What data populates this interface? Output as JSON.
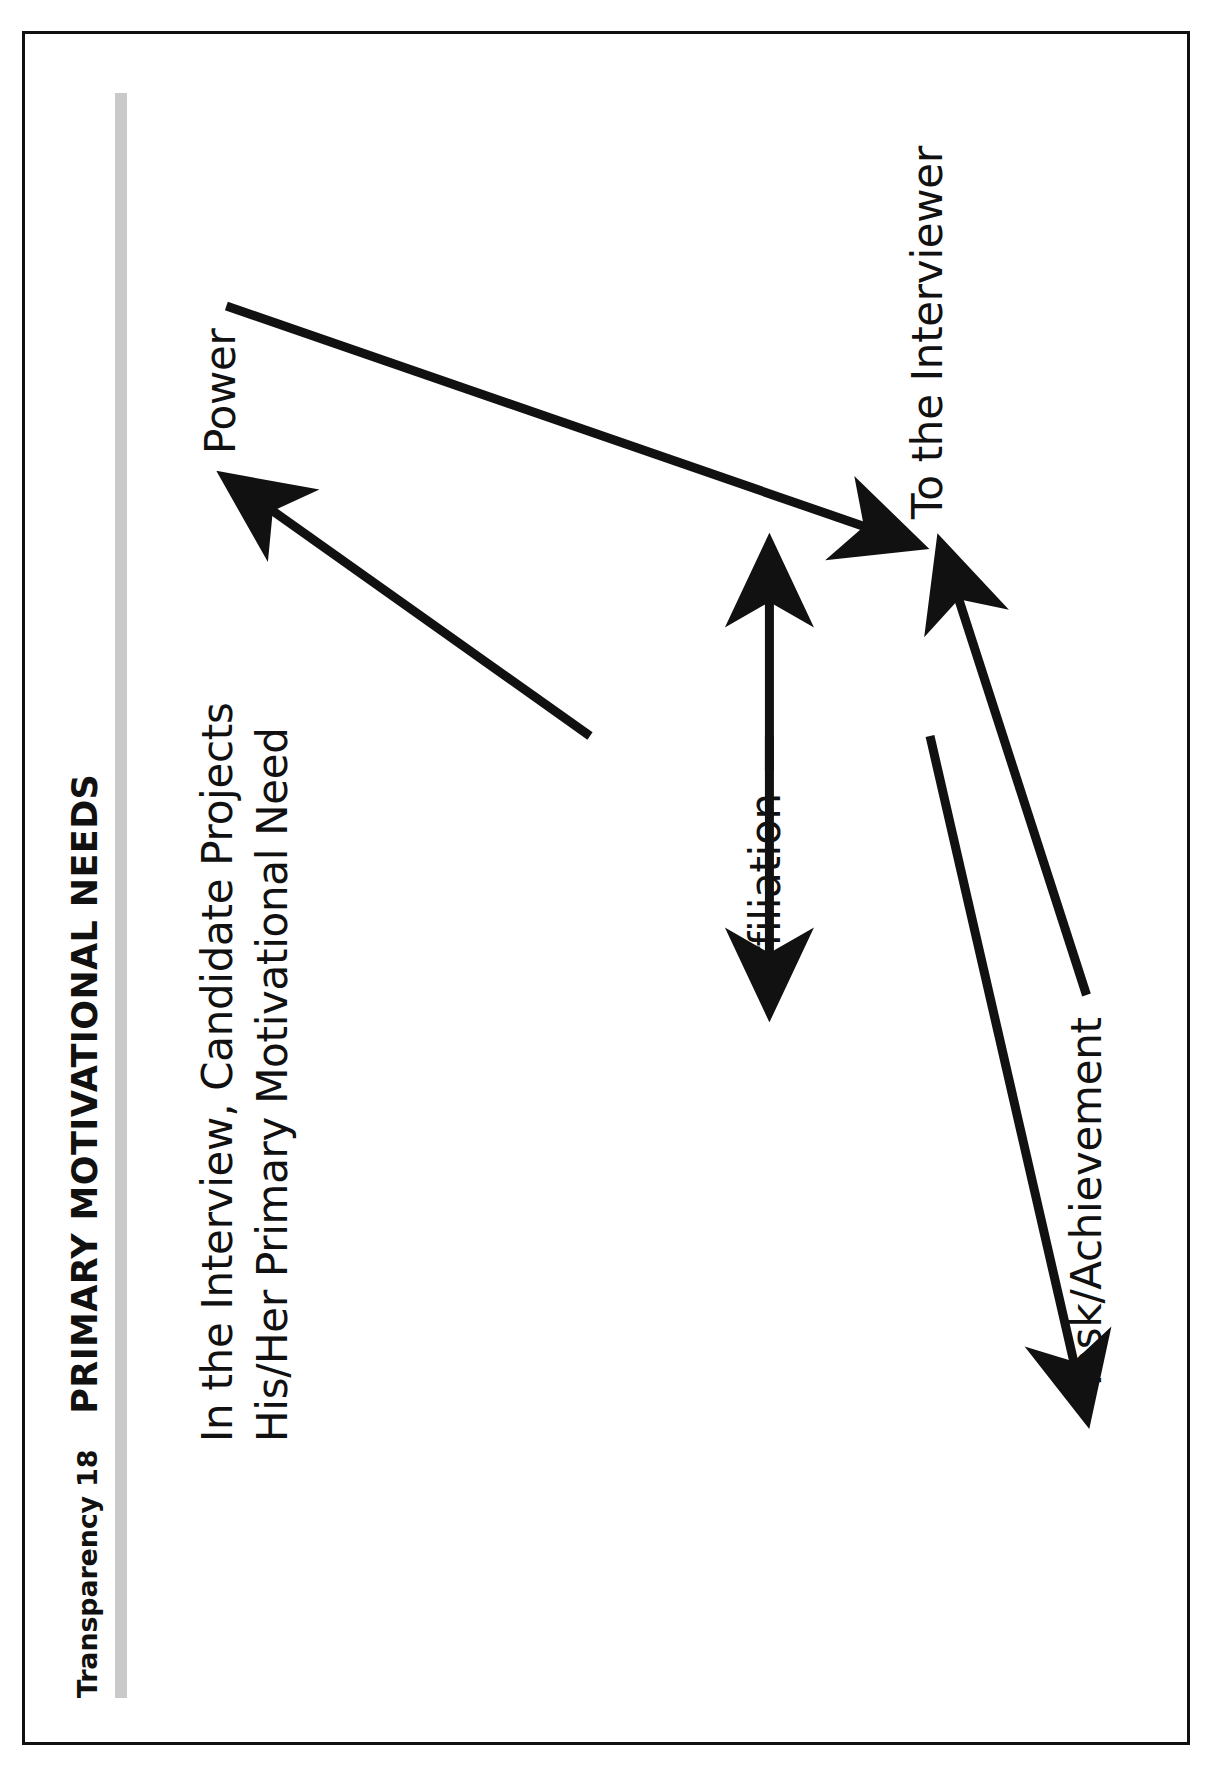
{
  "slide": {
    "transparency_label": "Transparency 18",
    "title": "PRIMARY MOTIVATIONAL NEEDS",
    "rule_color": "#c9c9c9",
    "border_color": "#111111",
    "background_color": "#ffffff",
    "text_color": "#111111"
  },
  "intro": {
    "line1": "In the Interview, Candidate Projects",
    "line2": "His/Her Primary Motivational Need"
  },
  "diagram": {
    "type": "flow",
    "source_label": "In the Interview, Candidate Projects His/Her Primary Motivational Need",
    "target_label": "To the Interviewer",
    "nodes": [
      {
        "id": "power",
        "label": "Power"
      },
      {
        "id": "affiliation",
        "label": "Affiliation"
      },
      {
        "id": "task",
        "label": "Task/Achievement"
      }
    ],
    "arrows": [
      {
        "from": "source",
        "to": "power",
        "direction": "up-right"
      },
      {
        "from": "source",
        "to": "affiliation",
        "direction": "right"
      },
      {
        "from": "source",
        "to": "task",
        "direction": "down-right"
      },
      {
        "from": "power",
        "to": "target",
        "direction": "down-right"
      },
      {
        "from": "affiliation",
        "to": "target",
        "direction": "right"
      },
      {
        "from": "task",
        "to": "target",
        "direction": "up-right"
      }
    ]
  }
}
